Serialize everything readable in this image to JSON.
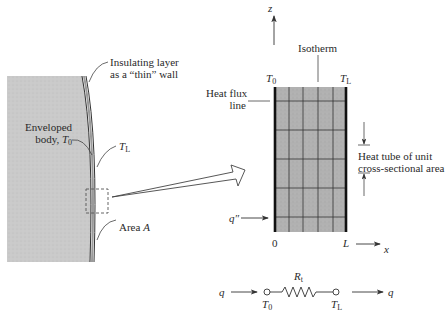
{
  "left_figure": {
    "insulating_layer_label_line1": "Insulating layer",
    "insulating_layer_label_line2": "as a “thin” wall",
    "body_label_line1": "Enveloped",
    "body_label_line2": "body, ",
    "body_temp_symbol": "T",
    "body_temp_sub": "0",
    "outer_temp_symbol": "T",
    "outer_temp_sub": "L",
    "area_label": "Area ",
    "area_symbol": "A"
  },
  "right_figure": {
    "z_axis_label": "z",
    "x_axis_label": "x",
    "isotherm_label": "Isotherm",
    "heat_flux_line_label_line1": "Heat flux",
    "heat_flux_line_label_line2": "line",
    "left_temp_symbol": "T",
    "left_temp_sub": "0",
    "right_temp_symbol": "T",
    "right_temp_sub": "L",
    "heat_tube_label_line1": "Heat tube of unit",
    "heat_tube_label_line2": "cross-sectional area",
    "flux_symbol": "q″",
    "origin_label": "0",
    "length_label": "L"
  },
  "circuit": {
    "input_label": "q",
    "output_label": "q",
    "resistance_symbol": "R",
    "resistance_sub": "t",
    "left_node_symbol": "T",
    "left_node_sub": "0",
    "right_node_symbol": "T",
    "right_node_sub": "L"
  },
  "colors": {
    "body_fill": "#c9c9c9",
    "slab_fill": "#b3b3b3",
    "line": "#333333"
  }
}
